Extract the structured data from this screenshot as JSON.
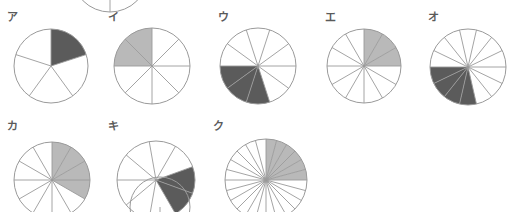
{
  "page": {
    "background_color": "#ffffff",
    "stroke_color": "#9a9a9a",
    "label_color": "#5a5a5a",
    "dark_fill": "#5b5b5b",
    "light_fill": "#b9b9b9",
    "width": 514,
    "height": 212
  },
  "figures": [
    {
      "id": "fig-top-partial",
      "label": "",
      "label_visible": false,
      "cx": 110,
      "cy": -26,
      "r": 38,
      "slices": 2,
      "shaded": 0,
      "start_angle": 90,
      "fill": "none",
      "clipped": true,
      "note": "bottom sliver of a circle cut off by the top edge of the page"
    },
    {
      "id": "fig-a",
      "label": "ア",
      "label_visible": true,
      "label_x": 7,
      "label_y": 12,
      "cx": 51,
      "cy": 66,
      "r": 37,
      "slices": 5,
      "shaded": 1,
      "fraction": "1/5",
      "start_angle": 90,
      "direction": "clockwise",
      "fill": "dark",
      "fill_color": "#5b5b5b"
    },
    {
      "id": "fig-b",
      "label": "イ",
      "label_visible": true,
      "label_x": 108,
      "label_y": 12,
      "cx": 152,
      "cy": 66,
      "r": 38,
      "slices": 8,
      "shaded": 2,
      "fraction": "2/8",
      "start_angle": 180,
      "direction": "clockwise",
      "fill": "light",
      "fill_color": "#b9b9b9"
    },
    {
      "id": "fig-c",
      "label": "ウ",
      "label_visible": true,
      "label_x": 218,
      "label_y": 12,
      "cx": 258,
      "cy": 66,
      "r": 38,
      "slices": 10,
      "shaded": 3,
      "fraction": "3/10",
      "start_angle": 180,
      "direction": "counterclockwise",
      "fill": "dark",
      "fill_color": "#5b5b5b"
    },
    {
      "id": "fig-d",
      "label": "エ",
      "label_visible": true,
      "label_x": 325,
      "label_y": 12,
      "cx": 364,
      "cy": 66,
      "r": 37,
      "slices": 12,
      "shaded": 3,
      "fraction": "3/12",
      "start_angle": 90,
      "direction": "clockwise",
      "fill": "light",
      "fill_color": "#b9b9b9"
    },
    {
      "id": "fig-e",
      "label": "オ",
      "label_visible": true,
      "label_x": 428,
      "label_y": 12,
      "cx": 468,
      "cy": 67,
      "r": 38,
      "slices": 14,
      "shaded": 4,
      "fraction": "4/14",
      "start_angle": 180,
      "direction": "counterclockwise",
      "fill": "dark",
      "fill_color": "#5b5b5b"
    },
    {
      "id": "fig-f",
      "label": "カ",
      "label_visible": true,
      "label_x": 7,
      "label_y": 121,
      "cx": 52,
      "cy": 180,
      "r": 38,
      "slices": 12,
      "shaded": 4,
      "fraction": "4/12",
      "start_angle": 90,
      "direction": "clockwise",
      "fill": "light",
      "fill_color": "#b9b9b9"
    },
    {
      "id": "fig-g",
      "label": "キ",
      "label_visible": true,
      "label_x": 108,
      "label_y": 121,
      "cx": 156,
      "cy": 180,
      "r": 39,
      "slices": 9,
      "shaded": 2,
      "fraction": "2/9",
      "start_angle": 20,
      "direction": "clockwise",
      "fill": "dark",
      "fill_color": "#5b5b5b"
    },
    {
      "id": "fig-h",
      "label": "ク",
      "label_visible": true,
      "label_x": 213,
      "label_y": 121,
      "cx": 266,
      "cy": 180,
      "r": 41,
      "slices": 24,
      "shaded": 6,
      "fraction": "6/24",
      "start_angle": 90,
      "direction": "clockwise",
      "fill": "light",
      "fill_color": "#b9b9b9"
    },
    {
      "id": "fig-row2-partial-a",
      "label": "",
      "label_visible": false,
      "cx": 160,
      "cy": 207,
      "r": 30,
      "slices": 1,
      "shaded": 0,
      "start_angle": 0,
      "fill": "none",
      "clipped": true,
      "note": "top arc of a circle cut off by the bottom edge of the page"
    }
  ]
}
